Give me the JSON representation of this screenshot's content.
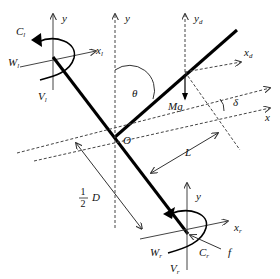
{
  "diagram": {
    "type": "mechanics free-body diagram",
    "labels": {
      "C_l": {
        "main": "C",
        "sub": "l"
      },
      "W_l": {
        "main": "W",
        "sub": "l"
      },
      "V_l": {
        "main": "V",
        "sub": "l"
      },
      "x_l": {
        "main": "x",
        "sub": "l"
      },
      "y_left": {
        "main": "y"
      },
      "y_center": {
        "main": "y"
      },
      "y_d": {
        "main": "y",
        "sub": "d"
      },
      "x_d": {
        "main": "x",
        "sub": "d"
      },
      "theta": "θ",
      "Mg": "Mg",
      "delta": "δ",
      "x": "x",
      "O": "O",
      "L": "L",
      "half_num": "1",
      "half_den": "2",
      "D": "D",
      "y_right": {
        "main": "y"
      },
      "x_r": {
        "main": "x",
        "sub": "r"
      },
      "W_r": {
        "main": "W",
        "sub": "r"
      },
      "C_r": {
        "main": "C",
        "sub": "r"
      },
      "V_r": {
        "main": "V",
        "sub": "r"
      },
      "f": "f"
    }
  }
}
